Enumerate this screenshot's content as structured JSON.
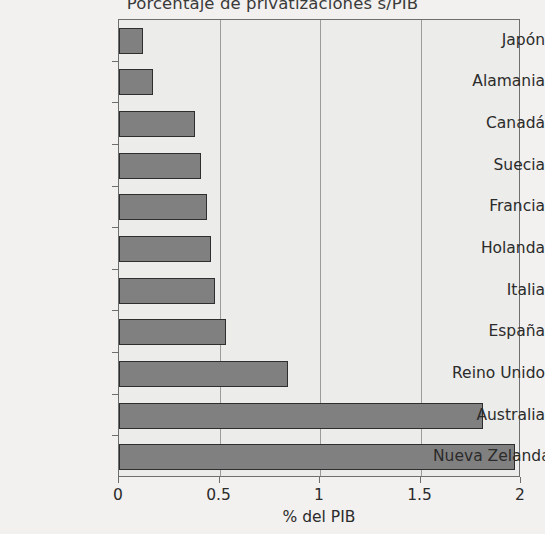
{
  "chart_data": {
    "type": "bar",
    "orientation": "horizontal",
    "title": "Porcentaje de privatizaciones s/PIB",
    "xlabel": "% del PIB",
    "ylabel": "",
    "xlim": [
      0,
      2
    ],
    "xticks": [
      "0",
      "0.5",
      "1",
      "1.5",
      "2"
    ],
    "xtick_values": [
      0,
      0.5,
      1,
      1.5,
      2
    ],
    "grid": "vertical",
    "legend": null,
    "categories": [
      "Japón",
      "Alamania",
      "Canadá",
      "Suecia",
      "Francia",
      "Holanda",
      "Italia",
      "España",
      "Reino Unido",
      "Australia",
      "Nueva Zelanda"
    ],
    "values": [
      0.12,
      0.17,
      0.38,
      0.41,
      0.44,
      0.46,
      0.48,
      0.53,
      0.84,
      1.81,
      1.97
    ],
    "colors": {
      "bar_fill": "#808080",
      "bar_border": "#2e2e2e",
      "plot_background": "#ececea",
      "figure_background": "#f2f1ef",
      "gridline": "#9c9c9c",
      "axis": "#6e6e6e",
      "text": "#2b2b2b",
      "title_text": "#3a3a3a"
    }
  }
}
